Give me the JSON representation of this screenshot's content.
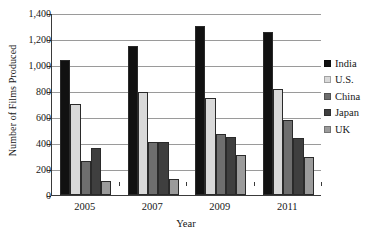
{
  "chart_data": {
    "type": "bar",
    "title": "",
    "xlabel": "Year",
    "ylabel": "Number of Films Produced",
    "categories": [
      "2005",
      "2007",
      "2009",
      "2011"
    ],
    "ylim": [
      0,
      1400
    ],
    "yticks": [
      0,
      200,
      400,
      600,
      800,
      1000,
      1200,
      1400
    ],
    "ytick_labels": [
      "0",
      "200",
      "400",
      "600",
      "800",
      "1,000",
      "1,200",
      "1,400"
    ],
    "grid": true,
    "legend_position": "right",
    "series": [
      {
        "name": "India",
        "color": "#111111",
        "values": [
          1040,
          1150,
          1300,
          1255
        ]
      },
      {
        "name": "U.S.",
        "color": "#d9d9d9",
        "values": [
          700,
          790,
          750,
          815
        ]
      },
      {
        "name": "China",
        "color": "#6e6e6e",
        "values": [
          260,
          410,
          470,
          580
        ]
      },
      {
        "name": "Japan",
        "color": "#3f3f3f",
        "values": [
          360,
          405,
          445,
          435
        ]
      },
      {
        "name": "UK",
        "color": "#9b9b9b",
        "values": [
          105,
          125,
          310,
          295
        ]
      }
    ]
  },
  "axes": {
    "y_title": "Number of Films Produced",
    "x_title": "Year"
  }
}
